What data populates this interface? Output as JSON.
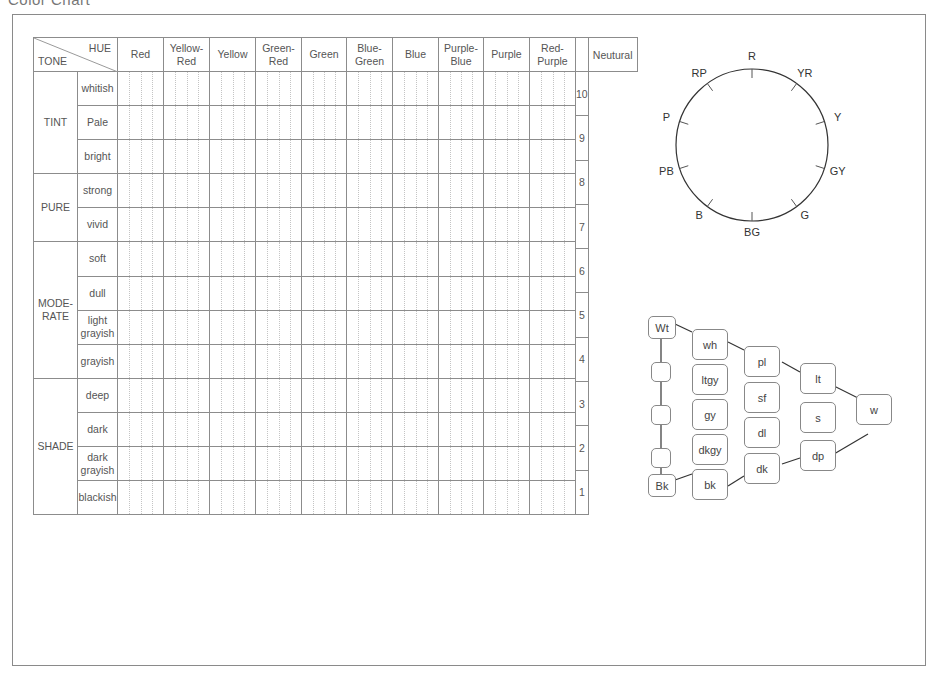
{
  "page": {
    "title": "Color Chart"
  },
  "table": {
    "corner": {
      "hue_label": "HUE",
      "tone_label": "TONE"
    },
    "hues": [
      {
        "line1": "Red",
        "line2": ""
      },
      {
        "line1": "Yellow-",
        "line2": "Red"
      },
      {
        "line1": "Yellow",
        "line2": ""
      },
      {
        "line1": "Green-",
        "line2": "Red"
      },
      {
        "line1": "Green",
        "line2": ""
      },
      {
        "line1": "Blue-",
        "line2": "Green"
      },
      {
        "line1": "Blue",
        "line2": ""
      },
      {
        "line1": "Purple-",
        "line2": "Blue"
      },
      {
        "line1": "Purple",
        "line2": ""
      },
      {
        "line1": "Red-",
        "line2": "Purple"
      }
    ],
    "neutral_header": "Neutural",
    "tone_groups": [
      {
        "line1": "TINT",
        "line2": "",
        "rows": [
          "whitish",
          "Pale",
          "bright"
        ]
      },
      {
        "line1": "PURE",
        "line2": "",
        "rows": [
          "strong",
          "vivid"
        ]
      },
      {
        "line1": "MODE-",
        "line2": "RATE",
        "rows": [
          "soft",
          "dull",
          "light grayish",
          "grayish"
        ]
      },
      {
        "line1": "SHADE",
        "line2": "",
        "rows": [
          "deep",
          "dark",
          "dark grayish",
          "blackish"
        ]
      }
    ],
    "tone_rows": [
      {
        "line1": "whitish",
        "line2": ""
      },
      {
        "line1": "Pale",
        "line2": ""
      },
      {
        "line1": "bright",
        "line2": ""
      },
      {
        "line1": "strong",
        "line2": ""
      },
      {
        "line1": "vivid",
        "line2": ""
      },
      {
        "line1": "soft",
        "line2": ""
      },
      {
        "line1": "dull",
        "line2": ""
      },
      {
        "line1": "light",
        "line2": "grayish"
      },
      {
        "line1": "grayish",
        "line2": ""
      },
      {
        "line1": "deep",
        "line2": ""
      },
      {
        "line1": "dark",
        "line2": ""
      },
      {
        "line1": "dark",
        "line2": "grayish"
      },
      {
        "line1": "blackish",
        "line2": ""
      }
    ],
    "neutral_values": [
      "10",
      "9",
      "8",
      "7",
      "6",
      "5",
      "4",
      "3",
      "2",
      "1"
    ]
  },
  "hue_wheel": {
    "labels": [
      "R",
      "YR",
      "Y",
      "GY",
      "G",
      "BG",
      "B",
      "PB",
      "P",
      "RP"
    ]
  },
  "tone_diagram": {
    "achromatic": {
      "top": "Wt",
      "bottom": "Bk",
      "middle_boxes": 3
    },
    "column1": [
      "wh",
      "ltgy",
      "gy",
      "dkgy",
      "bk"
    ],
    "column2": [
      "pl",
      "sf",
      "dl",
      "dk"
    ],
    "column3": [
      "lt",
      "s",
      "dp"
    ],
    "vivid": "w"
  }
}
